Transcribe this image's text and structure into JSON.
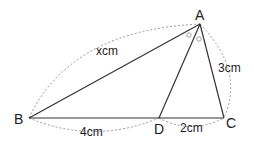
{
  "diagram": {
    "type": "triangle-angle-bisector",
    "points": {
      "A": "A",
      "B": "B",
      "C": "C",
      "D": "D"
    },
    "measurements": {
      "AB": "xcm",
      "AC": "3cm",
      "BD": "4cm",
      "DC": "2cm"
    },
    "equal_angle_marks": [
      "BAD",
      "DAC"
    ]
  }
}
